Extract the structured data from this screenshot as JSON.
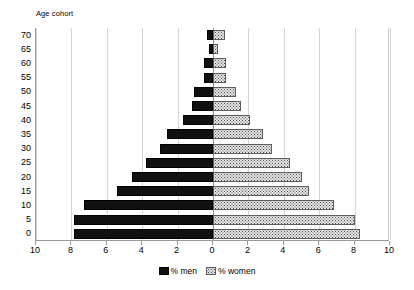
{
  "chart_data": {
    "type": "bar",
    "subtype": "population-pyramid",
    "title": "",
    "axis_title": "Age cohort",
    "xlabel": "",
    "ylabel": "Age cohort",
    "categories": [
      "70",
      "65",
      "60",
      "55",
      "50",
      "45",
      "40",
      "35",
      "30",
      "25",
      "20",
      "15",
      "10",
      "5",
      "0"
    ],
    "xtick_labels": [
      "10",
      "8",
      "6",
      "4",
      "2",
      "0",
      "2",
      "4",
      "6",
      "8",
      "10"
    ],
    "xtick_values": [
      -10,
      -8,
      -6,
      -4,
      -2,
      0,
      2,
      4,
      6,
      8,
      10
    ],
    "xlim": [
      -10,
      10
    ],
    "grid": true,
    "legend_position": "bottom",
    "series": [
      {
        "name": "% men",
        "side": "left",
        "color": "#111111",
        "values": [
          0.35,
          0.2,
          0.5,
          0.5,
          1.1,
          1.2,
          1.7,
          2.6,
          3.0,
          3.8,
          4.6,
          5.4,
          7.3,
          7.85,
          7.85
        ]
      },
      {
        "name": "% women",
        "side": "right",
        "color": "#e8e8e8",
        "values": [
          0.65,
          0.3,
          0.75,
          0.75,
          1.3,
          1.6,
          2.1,
          2.85,
          3.35,
          4.35,
          5.0,
          5.4,
          6.85,
          8.05,
          8.3
        ]
      }
    ]
  },
  "legend": {
    "items": [
      {
        "label": "% men",
        "swatch": "black-solid"
      },
      {
        "label": "% women",
        "swatch": "grey-dotted"
      }
    ]
  }
}
